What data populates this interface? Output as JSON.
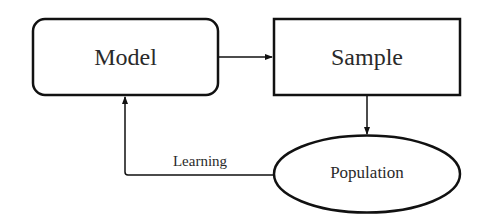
{
  "diagram": {
    "nodes": [
      {
        "id": "model",
        "label": "Model",
        "shape": "rounded-rectangle"
      },
      {
        "id": "sample",
        "label": "Sample",
        "shape": "rectangle"
      },
      {
        "id": "population",
        "label": "Population",
        "shape": "ellipse"
      }
    ],
    "edges": [
      {
        "from": "model",
        "to": "sample",
        "label": ""
      },
      {
        "from": "sample",
        "to": "population",
        "label": ""
      },
      {
        "from": "population",
        "to": "model",
        "label": "Learning"
      }
    ],
    "stroke_color": "#111111",
    "text_color": "#2a2a2a"
  }
}
